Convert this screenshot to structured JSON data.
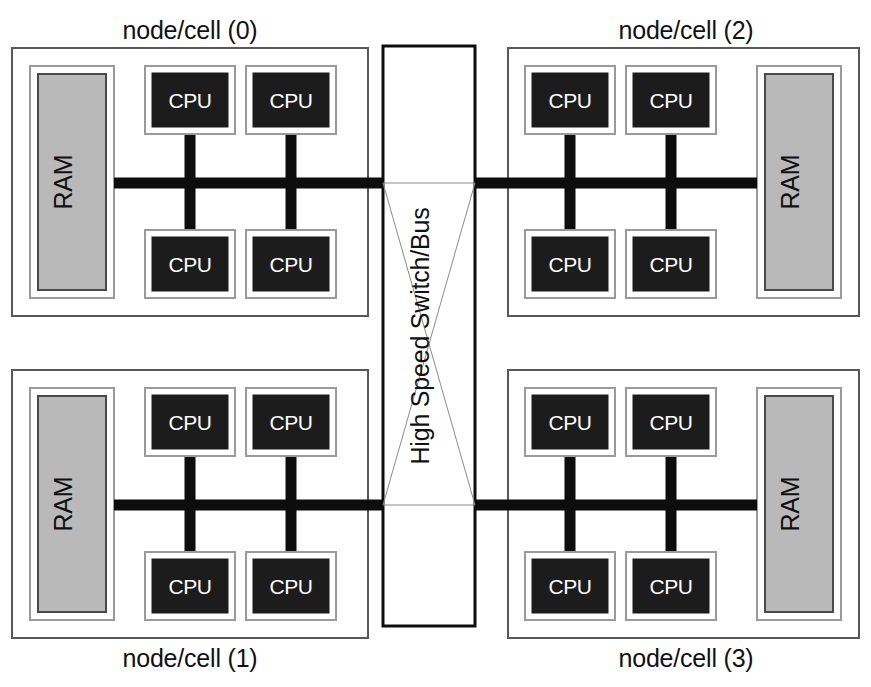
{
  "diagram": {
    "background_color": "#ffffff",
    "colors": {
      "node_border": "#585858",
      "inner_frame_border": "#9a9a9a",
      "ram_fill": "#b9b9b9",
      "ram_border": "#4a4a4a",
      "cpu_fill": "#1c1c1c",
      "cpu_text": "#ffffff",
      "bus_line": "#0d0d0d",
      "switch_border": "#0d0d0d",
      "switch_wire": "#8a8a8a",
      "label_text": "#111111"
    }
  },
  "switch": {
    "label": "High Speed Switch/Bus",
    "orientation": "vertical-bottom-to-top"
  },
  "nodes": [
    {
      "id": "node-0",
      "label": "node/cell (0)",
      "label_position": "above",
      "ram": {
        "label": "RAM",
        "side": "left"
      },
      "cpus": [
        {
          "label": "CPU",
          "position": "top-left"
        },
        {
          "label": "CPU",
          "position": "top-right"
        },
        {
          "label": "CPU",
          "position": "bottom-left"
        },
        {
          "label": "CPU",
          "position": "bottom-right"
        }
      ],
      "bus_side": "right"
    },
    {
      "id": "node-1",
      "label": "node/cell (1)",
      "label_position": "below",
      "ram": {
        "label": "RAM",
        "side": "left"
      },
      "cpus": [
        {
          "label": "CPU",
          "position": "top-left"
        },
        {
          "label": "CPU",
          "position": "top-right"
        },
        {
          "label": "CPU",
          "position": "bottom-left"
        },
        {
          "label": "CPU",
          "position": "bottom-right"
        }
      ],
      "bus_side": "right"
    },
    {
      "id": "node-2",
      "label": "node/cell (2)",
      "label_position": "above",
      "ram": {
        "label": "RAM",
        "side": "right"
      },
      "cpus": [
        {
          "label": "CPU",
          "position": "top-left"
        },
        {
          "label": "CPU",
          "position": "top-right"
        },
        {
          "label": "CPU",
          "position": "bottom-left"
        },
        {
          "label": "CPU",
          "position": "bottom-right"
        }
      ],
      "bus_side": "left"
    },
    {
      "id": "node-3",
      "label": "node/cell (3)",
      "label_position": "below",
      "ram": {
        "label": "RAM",
        "side": "right"
      },
      "cpus": [
        {
          "label": "CPU",
          "position": "top-left"
        },
        {
          "label": "CPU",
          "position": "top-right"
        },
        {
          "label": "CPU",
          "position": "bottom-left"
        },
        {
          "label": "CPU",
          "position": "bottom-right"
        }
      ],
      "bus_side": "left"
    }
  ]
}
